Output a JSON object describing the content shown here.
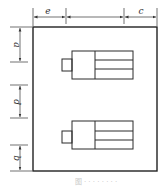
{
  "diagram": {
    "labels": {
      "top_left": "e",
      "top_right": "c",
      "left_upper": "a",
      "left_middle": "d",
      "left_lower": "b"
    },
    "components": [
      {
        "name": "upper-unit",
        "rows": 3
      },
      {
        "name": "lower-unit",
        "rows": 3
      }
    ],
    "caption": "图 · · · · · · · ·",
    "colors": {
      "stroke": "#222222",
      "background": "#ffffff"
    }
  }
}
